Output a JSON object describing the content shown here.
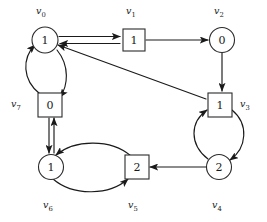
{
  "figure": {
    "background_color": "#ffffff",
    "stroke_color": "#1a1a1a",
    "width": 267,
    "height": 222
  },
  "nodes": [
    {
      "id": "v0",
      "label": "v",
      "subscript": "0",
      "value": "1",
      "shape": "circle",
      "cx": 45,
      "cy": 40,
      "r": 13,
      "label_x": 36,
      "label_y": 6
    },
    {
      "id": "v1",
      "label": "v",
      "subscript": "1",
      "value": "1",
      "shape": "square",
      "cx": 134,
      "cy": 40,
      "r": 11,
      "label_x": 126,
      "label_y": 6
    },
    {
      "id": "v2",
      "label": "v",
      "subscript": "2",
      "value": "0",
      "shape": "circle",
      "cx": 222,
      "cy": 40,
      "r": 12,
      "label_x": 214,
      "label_y": 6
    },
    {
      "id": "v3",
      "label": "v",
      "subscript": "3",
      "value": "1",
      "shape": "square",
      "cx": 219,
      "cy": 105,
      "r": 12,
      "label_x": 240,
      "label_y": 99
    },
    {
      "id": "v4",
      "label": "v",
      "subscript": "4",
      "value": "2",
      "shape": "circle",
      "cx": 219,
      "cy": 167,
      "r": 12,
      "label_x": 212,
      "label_y": 200
    },
    {
      "id": "v5",
      "label": "v",
      "subscript": "5",
      "value": "2",
      "shape": "square",
      "cx": 136,
      "cy": 167,
      "r": 12,
      "label_x": 128,
      "label_y": 200
    },
    {
      "id": "v6",
      "label": "v",
      "subscript": "6",
      "value": "1",
      "shape": "circle",
      "cx": 50,
      "cy": 167,
      "r": 12,
      "label_x": 43,
      "label_y": 200
    },
    {
      "id": "v7",
      "label": "v",
      "subscript": "7",
      "value": "0",
      "shape": "square",
      "cx": 49,
      "cy": 105,
      "r": 12,
      "label_x": 11,
      "label_y": 99
    }
  ],
  "edges": [
    {
      "id": "v0-to-v1",
      "from": "v0",
      "to": "v1",
      "style": "straight",
      "arrow": "end"
    },
    {
      "id": "v1-to-v0",
      "from": "v1",
      "to": "v0",
      "style": "straight",
      "arrow": "end"
    },
    {
      "id": "v1-to-v2",
      "from": "v1",
      "to": "v2",
      "style": "straight",
      "arrow": "end"
    },
    {
      "id": "v2-to-v3",
      "from": "v2",
      "to": "v3",
      "style": "straight",
      "arrow": "end"
    },
    {
      "id": "v3-to-v0",
      "from": "v3",
      "to": "v0",
      "style": "straight",
      "arrow": "end"
    },
    {
      "id": "v7-to-v0",
      "from": "v7",
      "to": "v0",
      "style": "curved-left",
      "arrow": "end"
    },
    {
      "id": "v0-to-v7",
      "from": "v0",
      "to": "v7",
      "style": "curved-right",
      "arrow": "end"
    },
    {
      "id": "v7-to-v6",
      "from": "v7",
      "to": "v6",
      "style": "straight",
      "arrow": "end"
    },
    {
      "id": "v6-to-v7",
      "from": "v6",
      "to": "v7",
      "style": "straight",
      "arrow": "end"
    },
    {
      "id": "v5-to-v6",
      "from": "v5",
      "to": "v6",
      "style": "curved-top",
      "arrow": "end"
    },
    {
      "id": "v6-to-v5",
      "from": "v6",
      "to": "v5",
      "style": "curved-bottom",
      "arrow": "end"
    },
    {
      "id": "v4-to-v5",
      "from": "v4",
      "to": "v5",
      "style": "straight",
      "arrow": "end"
    },
    {
      "id": "v4-to-v3",
      "from": "v4",
      "to": "v3",
      "style": "curved-left",
      "arrow": "end"
    },
    {
      "id": "v3-to-v4",
      "from": "v3",
      "to": "v4",
      "style": "curved-right",
      "arrow": "end"
    }
  ],
  "paths": {
    "v0_v1_forward": "M 59,36.5 L 120,36.5",
    "v1_v0_backward": "M 120,43.5 L 60,43.5",
    "v1_v2": "M 146,40 L 208,40",
    "v2_v3": "M 222,53 L 222,91",
    "v3_v0": "M 206,99 L 58,45",
    "v7_v0": "M 40,94 C 22,80 22,58 35,45",
    "v0_v7": "M 57,50 C 70,66 68,86 60,97",
    "v7_v6": "M 49,118 L 49,153",
    "v6_v7": "M 54,153 L 54,118",
    "v5_v6": "M 131,156 C 110,138 74,140 56,155",
    "v6_v5": "M 53,179 C 74,197 110,195 128,179",
    "v4_v5": "M 206,167 L 150,167",
    "v4_v3": "M 208,159 C 189,144 190,122 207,110",
    "v3_v4": "M 232,110 C 249,124 247,148 230,160"
  }
}
